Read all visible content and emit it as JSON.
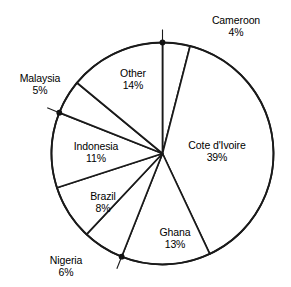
{
  "chart_data": {
    "type": "pie",
    "title": "",
    "subtitle": "",
    "xlabel": "",
    "ylabel": "",
    "legend": "none",
    "grid": false,
    "units": "%",
    "start_angle_deg": 0,
    "direction": "clockwise",
    "categories": [
      "Cameroon",
      "Cote d'Ivoire",
      "Ghana",
      "Nigeria",
      "Brazil",
      "Indonesia",
      "Malaysia",
      "Other"
    ],
    "values": [
      4,
      39,
      13,
      6,
      8,
      11,
      5,
      14
    ],
    "slices": [
      {
        "name": "Cameroon",
        "value": 4,
        "value_text": "4%",
        "label_placement": "outside",
        "has_leader_line": true,
        "label_x": 236,
        "label_y": 14
      },
      {
        "name": "Cote d'Ivoire",
        "value": 39,
        "value_text": "39%",
        "label_placement": "inside",
        "has_leader_line": false,
        "label_x": 217,
        "label_y": 139
      },
      {
        "name": "Ghana",
        "value": 13,
        "value_text": "13%",
        "label_placement": "inside",
        "has_leader_line": false,
        "label_x": 175,
        "label_y": 226
      },
      {
        "name": "Nigeria",
        "value": 6,
        "value_text": "6%",
        "label_placement": "outside",
        "has_leader_line": true,
        "label_x": 66,
        "label_y": 254
      },
      {
        "name": "Brazil",
        "value": 8,
        "value_text": "8%",
        "label_placement": "inside",
        "label_x": 103,
        "label_y": 190
      },
      {
        "name": "Indonesia",
        "value": 11,
        "value_text": "11%",
        "label_placement": "inside",
        "has_leader_line": false,
        "label_x": 96,
        "label_y": 140
      },
      {
        "name": "Malaysia",
        "value": 5,
        "value_text": "5%",
        "label_placement": "outside",
        "has_leader_line": true,
        "label_x": 40,
        "label_y": 72
      },
      {
        "name": "Other",
        "value": 14,
        "value_text": "14%",
        "label_placement": "inside",
        "has_leader_line": false,
        "label_x": 133,
        "label_y": 67
      }
    ],
    "geometry": {
      "center_x": 162.5,
      "center_y": 153.5,
      "radius": 111
    },
    "colors": {
      "background": "#ffffff",
      "stroke": "#1a1a1a",
      "text": "#000000",
      "slice_fill": "#ffffff"
    }
  }
}
